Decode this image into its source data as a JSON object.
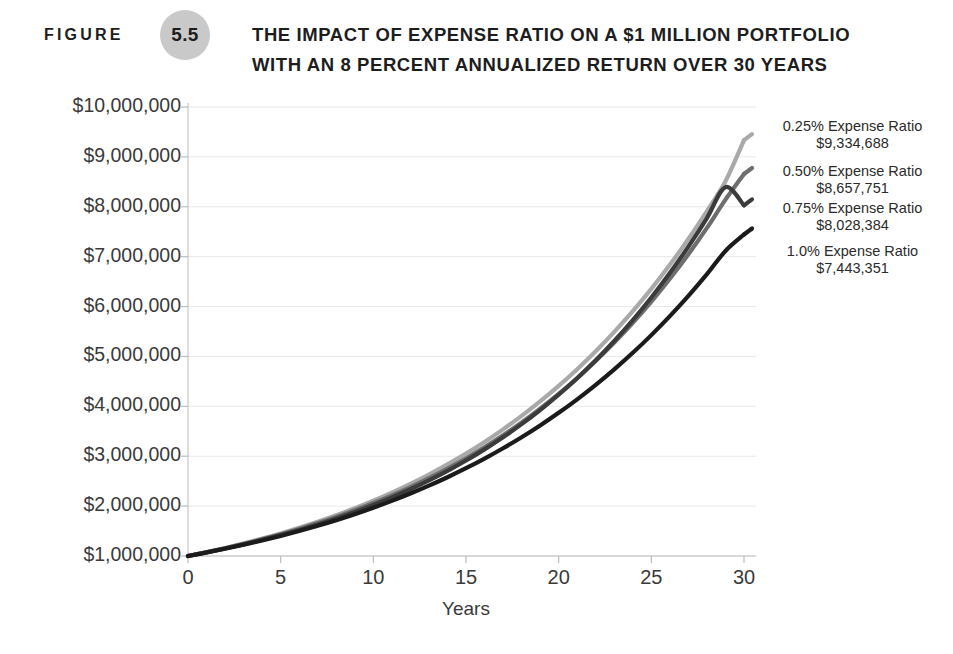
{
  "header": {
    "figure_word": "FIGURE",
    "figure_number": "5.5",
    "title_line_1": "THE IMPACT OF EXPENSE RATIO ON A $1 MILLION PORTFOLIO",
    "title_line_2": "WITH AN 8 PERCENT ANNUALIZED RETURN OVER 30 YEARS",
    "badge_color": "#c9c9c9"
  },
  "chart_data": {
    "type": "line",
    "title": "THE IMPACT OF EXPENSE RATIO ON A $1 MILLION PORTFOLIO WITH AN 8 PERCENT ANNUALIZED RETURN OVER 30 YEARS",
    "xlabel": "Years",
    "ylabel": "",
    "xlim": [
      0,
      30
    ],
    "ylim": [
      1000000,
      10000000
    ],
    "grid": true,
    "legend_position": "right-inline-annotations",
    "x_ticks": [
      0,
      5,
      10,
      15,
      20,
      25,
      30
    ],
    "x_tick_labels": [
      "0",
      "5",
      "10",
      "15",
      "20",
      "25",
      "30"
    ],
    "y_ticks": [
      1000000,
      2000000,
      3000000,
      4000000,
      5000000,
      6000000,
      7000000,
      8000000,
      9000000,
      10000000
    ],
    "y_tick_labels": [
      "$1,000,000",
      "$2,000,000",
      "$3,000,000",
      "$4,000,000",
      "$5,000,000",
      "$6,000,000",
      "$7,000,000",
      "$8,000,000",
      "$9,000,000",
      "$10,000,000"
    ],
    "x": [
      0,
      1,
      2,
      3,
      4,
      5,
      6,
      7,
      8,
      9,
      10,
      11,
      12,
      13,
      14,
      15,
      16,
      17,
      18,
      19,
      20,
      21,
      22,
      23,
      24,
      25,
      26,
      27,
      28,
      29,
      30
    ],
    "series": [
      {
        "name": "0.25% Expense Ratio",
        "end_label": "$9,334,688",
        "end_value": 9334688,
        "color": "#a9a9a9",
        "net_rate_percent": 7.75,
        "values": [
          1000000,
          1077500,
          1160931,
          1250853,
          1347794,
          1452248,
          1564797,
          1685969,
          1816432,
          1956906,
          2108066,
          2270692,
          2445621,
          2633732,
          2835965,
          3053327,
          3286960,
          3538100,
          3808303,
          4098447,
          4410077,
          4744858,
          5104584,
          5491289,
          5907164,
          6354469,
          6835891,
          7354167,
          7912114,
          8512673,
          9334688
        ]
      },
      {
        "name": "0.50% Expense Ratio",
        "end_label": "$8,657,751",
        "end_value": 8657751,
        "color": "#6e6e6e",
        "net_rate_percent": 7.5,
        "values": [
          1000000,
          1075000,
          1155625,
          1242297,
          1335469,
          1435629,
          1543302,
          1659049,
          1783478,
          1917239,
          2061032,
          2215609,
          2381780,
          2560413,
          2752444,
          2958877,
          3180793,
          3419353,
          3675804,
          3951489,
          4247851,
          4566440,
          4908923,
          5277092,
          5672874,
          6098340,
          6555716,
          7047395,
          7575950,
          8144146,
          8657751
        ]
      },
      {
        "name": "0.75% Expense Ratio",
        "end_label": "$8,028,384",
        "end_value": 8028384,
        "color": "#3b3b3b",
        "net_rate_percent": 7.25,
        "values": [
          1000000,
          1072500,
          1150056,
          1233185,
          1322436,
          1418413,
          1521748,
          1633124,
          1753275,
          1882987,
          2023104,
          2174529,
          2338233,
          2515255,
          2706710,
          2913797,
          3137802,
          3380103,
          3642185,
          3925643,
          4232202,
          4563727,
          4922232,
          5309894,
          5729061,
          6182269,
          6672254,
          7201972,
          7774615,
          8393635,
          8028384
        ]
      },
      {
        "name": "1.0% Expense Ratio",
        "end_label": "$7,443,351",
        "end_value": 7443351,
        "color": "#1b1b1b",
        "net_rate_percent": 7.0,
        "values": [
          1000000,
          1070000,
          1144900,
          1225043,
          1310796,
          1402552,
          1500730,
          1605781,
          1718186,
          1838459,
          1967151,
          2104852,
          2252192,
          2409845,
          2578534,
          2759032,
          2952164,
          3158815,
          3379932,
          3616528,
          3869684,
          4140562,
          4430402,
          4740530,
          5072367,
          5427433,
          5807353,
          6213868,
          6648838,
          7114257,
          7443351
        ]
      }
    ]
  },
  "axis_colors": {
    "gridline": "#e8e8e8",
    "axis": "#bdbdbd",
    "tick_text": "#3a3a3a"
  }
}
